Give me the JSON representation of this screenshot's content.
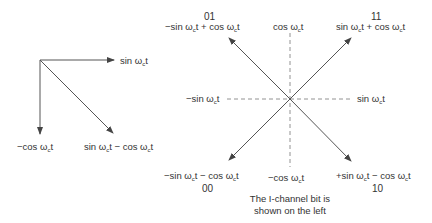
{
  "left_diagram": {
    "labels": {
      "sin": "sin ωct",
      "neg_cos": "−cos ωct",
      "sum": "sin ωct − cos ωct"
    }
  },
  "right_diagram": {
    "axes": {
      "top": "cos ωct",
      "bottom": "−cos ωct",
      "left": "−sin ωct",
      "right": "sin ωct"
    },
    "points": [
      {
        "code": "01",
        "label": "−sin ωct + cos ωct",
        "quadrant": "top-left"
      },
      {
        "code": "11",
        "label": "sin ωct + cos ωct",
        "quadrant": "top-right"
      },
      {
        "code": "00",
        "label": "−sin ωct − cos ωct",
        "quadrant": "bottom-left"
      },
      {
        "code": "10",
        "label": "+sin ωct − cos ωct",
        "quadrant": "bottom-right"
      }
    ],
    "caption_line1": "The I-channel bit is",
    "caption_line2": "shown on the left"
  },
  "colors": {
    "line": "#555555",
    "text": "#333333"
  }
}
